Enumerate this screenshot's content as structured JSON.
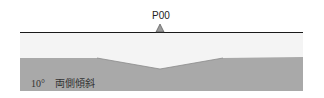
{
  "diagram": {
    "station_label": "P00",
    "slope_label": "10°　両側傾斜",
    "colors": {
      "surface_line": "#1a1a1a",
      "light_layer": "#f4f4f4",
      "dark_layer": "#a9a9a9",
      "marker": "#9a9a9a"
    }
  }
}
